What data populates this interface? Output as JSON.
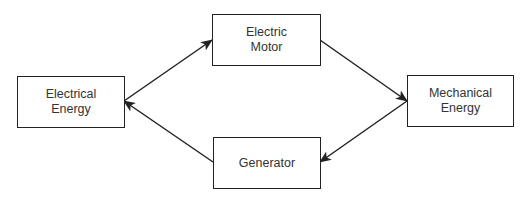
{
  "diagram": {
    "type": "energy-conversion-cycle",
    "nodes": [
      {
        "id": "electrical",
        "lines": [
          "Electrical",
          "Energy"
        ]
      },
      {
        "id": "motor",
        "lines": [
          "Electric",
          "Motor"
        ]
      },
      {
        "id": "mechanical",
        "lines": [
          "Mechanical",
          "Energy"
        ]
      },
      {
        "id": "generator",
        "lines": [
          "Generator"
        ]
      }
    ],
    "edges": [
      {
        "from": "electrical",
        "to": "motor"
      },
      {
        "from": "motor",
        "to": "mechanical"
      },
      {
        "from": "mechanical",
        "to": "generator"
      },
      {
        "from": "generator",
        "to": "electrical"
      }
    ],
    "colors": {
      "stroke": "#222222",
      "text": "#333333",
      "background": "#ffffff"
    }
  }
}
